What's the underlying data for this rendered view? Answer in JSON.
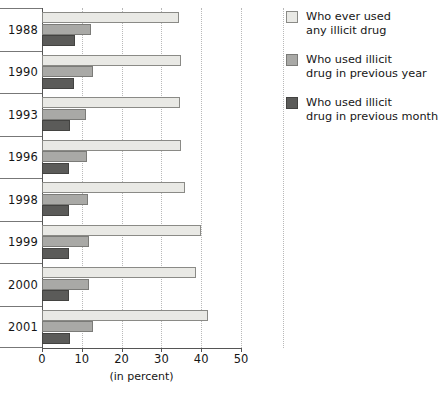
{
  "chart_data": {
    "type": "bar",
    "orientation": "horizontal",
    "title": "",
    "subtitle": "",
    "xlabel": "(in percent)",
    "ylabel": "",
    "xlim": [
      0,
      50
    ],
    "xticks": [
      0,
      10,
      20,
      30,
      40,
      50
    ],
    "grid": "vertical-dotted",
    "legend_position": "right",
    "categories": [
      "1988",
      "1990",
      "1993",
      "1996",
      "1998",
      "1999",
      "2000",
      "2001"
    ],
    "series": [
      {
        "name": "Who ever used any illicit drug",
        "color": "#e9e9e5",
        "values": [
          34.5,
          34.9,
          34.7,
          35.0,
          36.0,
          40.0,
          38.8,
          41.7
        ]
      },
      {
        "name": "Who used illicit drug in previous year",
        "color": "#a9a9a6",
        "values": [
          12.2,
          12.9,
          11.0,
          11.4,
          11.5,
          11.8,
          11.8,
          12.9
        ]
      },
      {
        "name": "Who used illicit drug in previous month",
        "color": "#5b5b59",
        "values": [
          8.2,
          8.1,
          7.0,
          6.9,
          6.8,
          6.9,
          6.9,
          7.1
        ]
      }
    ]
  },
  "legend": {
    "items": [
      {
        "label": "Who ever used\nany illicit drug",
        "swatch": "light-gray-swatch"
      },
      {
        "label": "Who used illicit\ndrug in previous year",
        "swatch": "medium-gray-swatch"
      },
      {
        "label": "Who used illicit\ndrug in previous month",
        "swatch": "dark-gray-swatch"
      }
    ]
  },
  "axis": {
    "x_title": "(in percent)",
    "tick_labels": [
      "0",
      "10",
      "20",
      "30",
      "40",
      "50"
    ]
  }
}
